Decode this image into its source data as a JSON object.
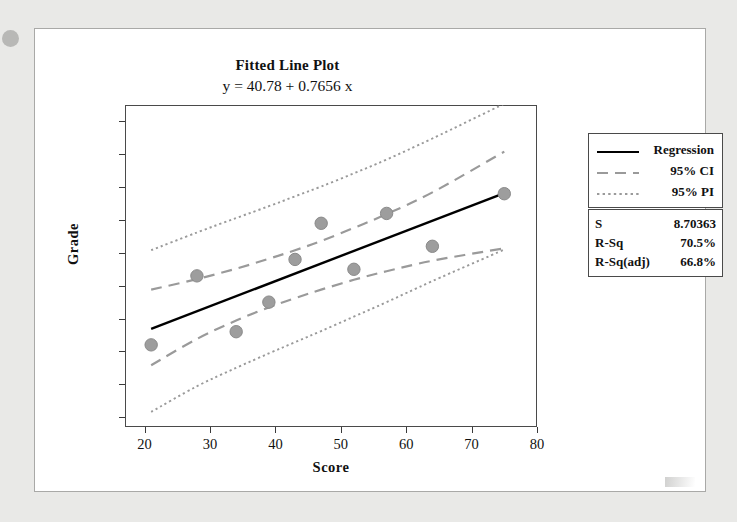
{
  "figure": {
    "title": "Fitted Line Plot",
    "subtitle": "y = 40.78 + 0.7656 x"
  },
  "legend": {
    "items": [
      {
        "label": "Regression",
        "style": "solid",
        "color": "#000000"
      },
      {
        "label": "95% CI",
        "style": "dashed",
        "color": "#9a9a9a"
      },
      {
        "label": "95% PI",
        "style": "dotted",
        "color": "#9a9a9a"
      }
    ]
  },
  "stats": {
    "rows": [
      {
        "key": "S",
        "value": "8.70363"
      },
      {
        "key": "R-Sq",
        "value": "70.5%"
      },
      {
        "key": "R-Sq(adj)",
        "value": "66.8%"
      }
    ]
  },
  "axes": {
    "x_label": "Score",
    "y_label": "Grade",
    "x_ticks": [
      "20",
      "30",
      "40",
      "50",
      "60",
      "70",
      "80"
    ],
    "y_ticks": [
      "30",
      "40",
      "50",
      "60",
      "70",
      "80",
      "90",
      "100",
      "110",
      "120"
    ]
  },
  "colors": {
    "point": "#9d9d9d",
    "point_edge": "#8a8a8a",
    "regression": "#000000",
    "interval": "#9a9a9a",
    "axis": "#3a3a3a",
    "page_background": "#e9e9e7",
    "figure_background": "#ffffff"
  },
  "chart_data": {
    "type": "scatter",
    "title": "Fitted Line Plot",
    "subtitle": "y = 40.78 + 0.7656 x",
    "xlabel": "Score",
    "ylabel": "Grade",
    "xlim": [
      17,
      80
    ],
    "ylim": [
      27,
      125
    ],
    "xticks": [
      20,
      30,
      40,
      50,
      60,
      70,
      80
    ],
    "yticks": [
      30,
      40,
      50,
      60,
      70,
      80,
      90,
      100,
      110,
      120
    ],
    "grid": false,
    "legend_position": "right-top",
    "points": [
      {
        "x": 21,
        "y": 52
      },
      {
        "x": 28,
        "y": 73
      },
      {
        "x": 34,
        "y": 56
      },
      {
        "x": 39,
        "y": 65
      },
      {
        "x": 43,
        "y": 78
      },
      {
        "x": 47,
        "y": 89
      },
      {
        "x": 52,
        "y": 75
      },
      {
        "x": 57,
        "y": 92
      },
      {
        "x": 64,
        "y": 82
      },
      {
        "x": 75,
        "y": 98
      }
    ],
    "fit": {
      "intercept": 40.78,
      "slope": 0.7656,
      "x_start": 21,
      "x_end": 75
    },
    "statistics": {
      "S": 8.70363,
      "R_Sq": 70.5,
      "R_Sq_adj": 66.8
    },
    "bands": {
      "ci": {
        "note": "95% confidence interval for the mean response",
        "x": [
          21,
          28,
          34,
          39,
          43,
          47,
          52,
          57,
          64,
          75
        ],
        "upper": [
          68.8,
          72.0,
          75.2,
          78.2,
          80.8,
          83.6,
          87.6,
          91.8,
          98.4,
          110.8
        ],
        "lower": [
          45.8,
          53.8,
          59.4,
          63.4,
          66.2,
          68.8,
          71.8,
          74.4,
          77.6,
          81.4
        ]
      },
      "pi": {
        "note": "95% prediction interval for a new observation",
        "x": [
          21,
          28,
          34,
          39,
          43,
          47,
          52,
          57,
          64,
          75
        ],
        "upper": [
          80.8,
          86.2,
          90.6,
          94.2,
          97.2,
          100.2,
          104.2,
          108.4,
          114.8,
          125.4
        ],
        "lower": [
          31.6,
          39.4,
          45.0,
          49.4,
          52.8,
          56.2,
          60.6,
          65.0,
          71.4,
          81.0
        ]
      }
    },
    "series": [
      {
        "name": "Regression",
        "style": "solid",
        "color": "#000000"
      },
      {
        "name": "95% CI",
        "style": "dashed",
        "color": "#9a9a9a"
      },
      {
        "name": "95% PI",
        "style": "dotted",
        "color": "#9a9a9a"
      }
    ]
  }
}
